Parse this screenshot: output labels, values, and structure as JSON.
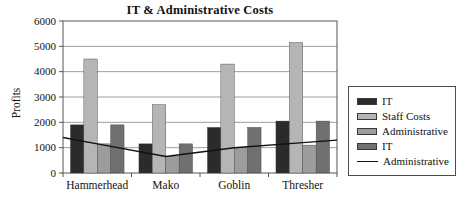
{
  "chart_data": {
    "type": "bar",
    "title": "IT & Administrative Costs",
    "ylabel": "Profits",
    "xlabel": "",
    "categories": [
      "Hammerhead",
      "Mako",
      "Goblin",
      "Thresher"
    ],
    "series": [
      {
        "name": "IT",
        "type": "bar",
        "color": "#2b2b2b",
        "values": [
          1900,
          1150,
          1800,
          2050
        ]
      },
      {
        "name": "Staff Costs",
        "type": "bar",
        "color": "#b5b5b5",
        "values": [
          4500,
          2700,
          4300,
          5150
        ]
      },
      {
        "name": "Administrative",
        "type": "bar",
        "color": "#9c9c9c",
        "values": [
          1150,
          650,
          1000,
          1100
        ]
      },
      {
        "name": "IT",
        "type": "bar",
        "color": "#707070",
        "values": [
          1900,
          1150,
          1800,
          2050
        ]
      },
      {
        "name": "Administrative",
        "type": "line",
        "color": "#111111",
        "values": [
          1150,
          650,
          1000,
          1200
        ]
      }
    ],
    "ylim": [
      0,
      6000
    ],
    "yticks": [
      0,
      1000,
      2000,
      3000,
      4000,
      5000,
      6000
    ],
    "grid": "horizontal",
    "legend_position": "right",
    "colors": {
      "background": "#ffffff",
      "gridline": "#9e9e9e",
      "axis": "#555555",
      "text": "#111111"
    }
  }
}
